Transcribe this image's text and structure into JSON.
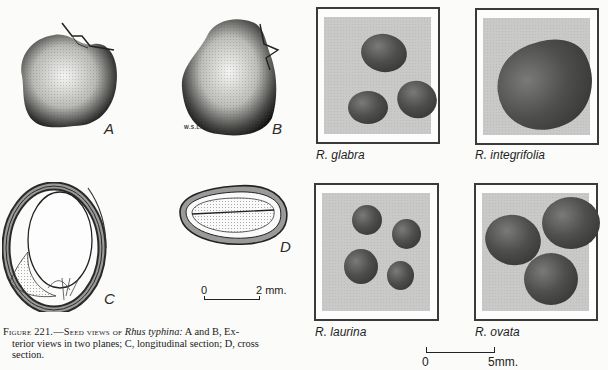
{
  "figure": {
    "number_label": "Figure 221.",
    "caption_lead": "Figure 221.—Seed views of ",
    "caption_species": "Rhus typhina:",
    "caption_line1_rest": " A and B, Ex-",
    "caption_line2": "terior views in two planes; C, longitudinal section; D, cross",
    "caption_line3": "section.",
    "caption_full": "Figure 221.—Seed views of Rhus typhina: A and B, Exterior views in two planes; C, longitudinal section; D, cross section."
  },
  "drawings": {
    "panels": [
      {
        "id": "A",
        "label": "A",
        "description": "Exterior view, plane 1"
      },
      {
        "id": "B",
        "label": "B",
        "description": "Exterior view, plane 2"
      },
      {
        "id": "C",
        "label": "C",
        "description": "Longitudinal section"
      },
      {
        "id": "D",
        "label": "D",
        "description": "Cross section"
      }
    ],
    "artist_signature": "W.S.L.",
    "scale_bar": {
      "start": "0",
      "end": "2 mm."
    }
  },
  "photos": {
    "items": [
      {
        "species": "R. glabra",
        "seed_count": 3
      },
      {
        "species": "R. integrifolia",
        "seed_count": 1
      },
      {
        "species": "R. laurina",
        "seed_count": 4
      },
      {
        "species": "R. ovata",
        "seed_count": 3
      }
    ],
    "scale_bar": {
      "start": "0",
      "end": "5mm."
    }
  },
  "colors": {
    "paper": "#fbfbfa",
    "ink": "#1a1a1a",
    "photo_bg": "#c9c9c7",
    "seed_dark": "#2c2c2c"
  }
}
